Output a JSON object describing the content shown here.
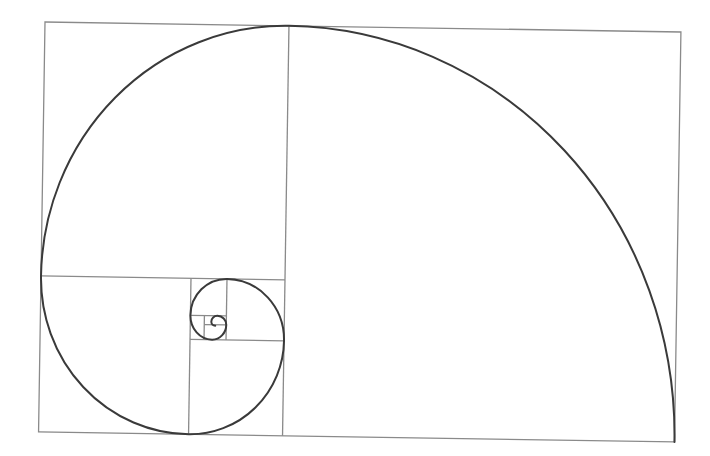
{
  "diagram": {
    "frame": {
      "origin": [
        45,
        22
      ],
      "width": 636,
      "height": 410,
      "rotation_deg": 0.9,
      "frame_color": "#8a8a8a",
      "spiral_color": "#3a3a3a"
    },
    "squares": [
      {
        "label": "square-1",
        "x": 243,
        "y": 0,
        "size": 393
      },
      {
        "label": "square-2",
        "x": 0,
        "y": 0,
        "size": 243
      },
      {
        "label": "square-3",
        "x": 0,
        "y": 253,
        "size": 150
      },
      {
        "label": "square-4",
        "x": 150,
        "y": 316,
        "size": 93
      },
      {
        "label": "square-5",
        "x": 150,
        "y": 253,
        "size": 57
      },
      {
        "label": "square-6",
        "x": 186,
        "y": 257,
        "size": 36
      },
      {
        "label": "square-7",
        "x": 163,
        "y": 294,
        "size": 22
      }
    ]
  }
}
